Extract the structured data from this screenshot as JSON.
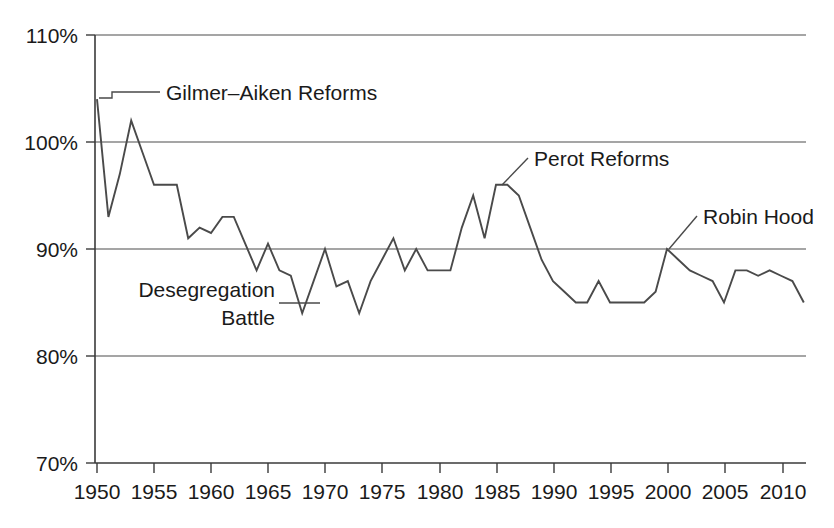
{
  "chart_data": {
    "type": "line",
    "title": "",
    "subtitle": "",
    "xlabel": "",
    "ylabel": "",
    "xlim": [
      1949,
      2012
    ],
    "ylim": [
      70,
      110
    ],
    "grid": true,
    "legend": "none",
    "x_ticks": [
      "1950",
      "1955",
      "1960",
      "1965",
      "1970",
      "1975",
      "1980",
      "1985",
      "1990",
      "1995",
      "2000",
      "2005",
      "2010"
    ],
    "x_tick_values": [
      1950,
      1955,
      1960,
      1965,
      1970,
      1975,
      1980,
      1985,
      1990,
      1995,
      2000,
      2005,
      2010
    ],
    "y_ticks": [
      "70%",
      "80%",
      "90%",
      "100%",
      "110%"
    ],
    "y_tick_values": [
      70,
      80,
      90,
      100,
      110
    ],
    "series": [
      {
        "name": "Value",
        "x": [
          1950,
          1951,
          1952,
          1953,
          1954,
          1955,
          1956,
          1957,
          1958,
          1959,
          1960,
          1961,
          1962,
          1963,
          1964,
          1965,
          1966,
          1967,
          1968,
          1969,
          1970,
          1971,
          1972,
          1973,
          1974,
          1975,
          1976,
          1977,
          1978,
          1979,
          1980,
          1981,
          1982,
          1983,
          1984,
          1985,
          1986,
          1987,
          1988,
          1989,
          1990,
          1991,
          1992,
          1993,
          1994,
          1995,
          1996,
          1997,
          1998,
          1999,
          2000,
          2001,
          2002,
          2003,
          2004,
          2005,
          2006,
          2007,
          2008,
          2009,
          2010,
          2011,
          2012
        ],
        "values": [
          104,
          93,
          97,
          102,
          99,
          96,
          96,
          96,
          91,
          92,
          91.5,
          93,
          93,
          90.5,
          88,
          90.5,
          88,
          87.5,
          84,
          87,
          90,
          86.5,
          87,
          84,
          87,
          89,
          91,
          88,
          90,
          88,
          88,
          88,
          92,
          95,
          91,
          96,
          96,
          95,
          92,
          89,
          87,
          86,
          85,
          85,
          87,
          85,
          85,
          85,
          85,
          86,
          90,
          89,
          88,
          87.5,
          87,
          85,
          88,
          88,
          87.5,
          88,
          87.5,
          87,
          85
        ]
      }
    ],
    "annotations": [
      {
        "text": "Gilmer–Aiken Reforms",
        "x": 1950,
        "y": 104
      },
      {
        "text": "Desegregation",
        "x": 1967,
        "y": 85
      },
      {
        "text": "Battle",
        "x": 1967,
        "y": 85
      },
      {
        "text": "Perot Reforms",
        "x": 1985,
        "y": 96
      },
      {
        "text": "Robin Hood",
        "x": 2000,
        "y": 90
      }
    ]
  },
  "axis": {
    "y_labels": [
      "110%",
      "100%",
      "90%",
      "80%",
      "70%"
    ],
    "x_labels": [
      "1950",
      "1955",
      "1960",
      "1965",
      "1970",
      "1975",
      "1980",
      "1985",
      "1990",
      "1995",
      "2000",
      "2005",
      "2010"
    ]
  },
  "annotations": {
    "gilmer_aiken": "Gilmer–Aiken Reforms",
    "desegregation_line1": "Desegregation",
    "desegregation_line2": "Battle",
    "perot": "Perot Reforms",
    "robin_hood": "Robin Hood"
  },
  "colors": {
    "line": "#4a4a4a",
    "grid": "#4d4d4d",
    "axis": "#3a3a3a",
    "text": "#1a1a1a",
    "background": "#ffffff"
  }
}
